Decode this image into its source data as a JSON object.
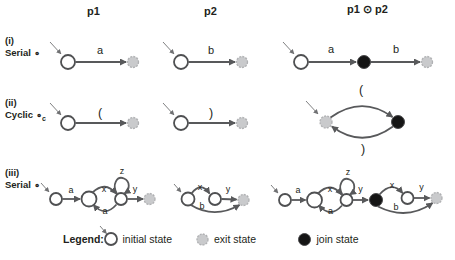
{
  "columns": {
    "p1": "p1",
    "p2": "p2",
    "combined": "p1 ⊙ p2"
  },
  "rows": {
    "i": {
      "index": "(i)",
      "name": "Serial",
      "op": "∘",
      "sub": ""
    },
    "ii": {
      "index": "(ii)",
      "name": "Cyclic",
      "op": "∘",
      "sub": "c"
    },
    "iii": {
      "index": "(iii)",
      "name": "Serial",
      "op": "∘",
      "sub": ""
    }
  },
  "edges": {
    "i_p1": "a",
    "i_p2": "b",
    "i_c_left": "a",
    "i_c_right": "b",
    "ii_p1": "(",
    "ii_p2": ")",
    "ii_c_top": "(",
    "ii_c_bottom": ")",
    "iii_p1": {
      "in": "a",
      "top": "x",
      "bottom": "a",
      "loop": "z",
      "out": "y"
    },
    "iii_p2": {
      "top": "x",
      "out": "y",
      "bottom": "b"
    },
    "iii_c": {
      "in": "a",
      "top1": "x",
      "bottom1": "a",
      "loop": "z",
      "mid": "y",
      "top2": "x",
      "out": "y",
      "bottom2": "b"
    }
  },
  "legend": {
    "title": "Legend:",
    "initial": "initial state",
    "exit": "exit state",
    "join": "join state"
  },
  "colors": {
    "line": "#58595b",
    "text": "#231f20",
    "initial_fill": "#ffffff",
    "exit_fill": "#c9cacc",
    "join_fill": "#151515",
    "background": "#ffffff"
  }
}
